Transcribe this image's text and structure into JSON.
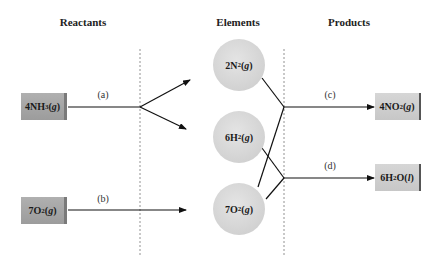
{
  "headers": {
    "reactants": "Reactants",
    "elements": "Elements",
    "products": "Products"
  },
  "reactants": [
    {
      "coef": "4",
      "formula": "NH",
      "sub": "3",
      "phase": "g"
    },
    {
      "coef": "7",
      "formula": "O",
      "sub": "2",
      "phase": "g"
    }
  ],
  "elements": [
    {
      "coef": "2",
      "formula": "N",
      "sub": "2",
      "phase": "g"
    },
    {
      "coef": "6",
      "formula": "H",
      "sub": "2",
      "phase": "g"
    },
    {
      "coef": "7",
      "formula": "O",
      "sub": "2",
      "phase": "g"
    }
  ],
  "products": [
    {
      "coef": "4",
      "formula": "NO",
      "sub": "2",
      "phase": "g"
    },
    {
      "coef": "6",
      "formula": "H",
      "sub": "2",
      "formula2": "O",
      "phase": "l"
    }
  ],
  "step_labels": {
    "a": "(a)",
    "b": "(b)",
    "c": "(c)",
    "d": "(d)"
  }
}
